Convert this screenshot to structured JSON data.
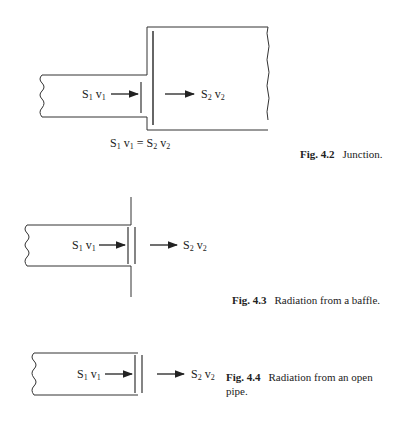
{
  "figures": [
    {
      "id": "fig-4-2",
      "number": "Fig. 4.2",
      "caption": "Junction.",
      "labels": {
        "left": {
          "S": "S",
          "s_sub": "1",
          "v": "v",
          "v_sub": "1"
        },
        "right": {
          "S": "S",
          "s_sub": "2",
          "v": "v",
          "v_sub": "2"
        }
      },
      "equation": {
        "lhs_S": "S",
        "lhs_s_sub": "1",
        "lhs_v": "v",
        "lhs_v_sub": "1",
        "eq": "=",
        "rhs_S": "S",
        "rhs_s_sub": "2",
        "rhs_v": "v",
        "rhs_v_sub": "2"
      }
    },
    {
      "id": "fig-4-3",
      "number": "Fig. 4.3",
      "caption": "Radiation from a baffle.",
      "labels": {
        "left": {
          "S": "S",
          "s_sub": "1",
          "v": "v",
          "v_sub": "1"
        },
        "right": {
          "S": "S",
          "s_sub": "2",
          "v": "v",
          "v_sub": "2"
        }
      }
    },
    {
      "id": "fig-4-4",
      "number": "Fig. 4.4",
      "caption_line1": "Radiation from an open",
      "caption_line2": "pipe.",
      "labels": {
        "left": {
          "S": "S",
          "s_sub": "1",
          "v": "v",
          "v_sub": "1"
        },
        "right": {
          "S": "S",
          "s_sub": "2",
          "v": "v",
          "v_sub": "2"
        }
      }
    }
  ]
}
